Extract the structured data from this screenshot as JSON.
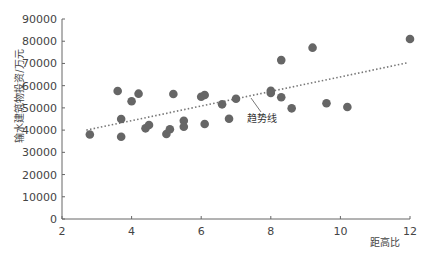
{
  "chart_data": {
    "type": "scatter",
    "title": "",
    "xlabel": "距高比",
    "ylabel": "输水建筑物投资/万元",
    "xlim": [
      2,
      12
    ],
    "ylim": [
      0,
      90000
    ],
    "xticks": [
      2,
      4,
      6,
      8,
      10,
      12
    ],
    "yticks": [
      0,
      10000,
      20000,
      30000,
      40000,
      50000,
      60000,
      70000,
      80000,
      90000
    ],
    "grid": false,
    "legend": null,
    "series": [
      {
        "name": "数据点",
        "color": "#666666",
        "points": [
          {
            "x": 2.8,
            "y": 38000
          },
          {
            "x": 3.6,
            "y": 57600
          },
          {
            "x": 3.7,
            "y": 45000
          },
          {
            "x": 3.7,
            "y": 37000
          },
          {
            "x": 4.0,
            "y": 53000
          },
          {
            "x": 4.2,
            "y": 56400
          },
          {
            "x": 4.4,
            "y": 40800
          },
          {
            "x": 4.5,
            "y": 42300
          },
          {
            "x": 5.0,
            "y": 38250
          },
          {
            "x": 5.1,
            "y": 40400
          },
          {
            "x": 5.2,
            "y": 56250
          },
          {
            "x": 5.5,
            "y": 44200
          },
          {
            "x": 5.5,
            "y": 41500
          },
          {
            "x": 6.0,
            "y": 55000
          },
          {
            "x": 6.1,
            "y": 55800
          },
          {
            "x": 6.1,
            "y": 42750
          },
          {
            "x": 6.6,
            "y": 51600
          },
          {
            "x": 6.8,
            "y": 45100
          },
          {
            "x": 7.0,
            "y": 54100
          },
          {
            "x": 8.0,
            "y": 57700
          },
          {
            "x": 8.0,
            "y": 56700
          },
          {
            "x": 8.3,
            "y": 71500
          },
          {
            "x": 8.3,
            "y": 54800
          },
          {
            "x": 8.6,
            "y": 49800
          },
          {
            "x": 9.2,
            "y": 77100
          },
          {
            "x": 9.6,
            "y": 52100
          },
          {
            "x": 10.2,
            "y": 50400
          },
          {
            "x": 12.0,
            "y": 81000
          }
        ]
      }
    ],
    "trendline": {
      "label": "趋势线",
      "style": "dotted",
      "color": "#777777",
      "start": {
        "x": 2.7,
        "y": 40000
      },
      "end": {
        "x": 11.9,
        "y": 70200
      }
    },
    "annotations": [
      {
        "text": "趋势线",
        "x": 8.0,
        "y": 54000
      }
    ]
  }
}
